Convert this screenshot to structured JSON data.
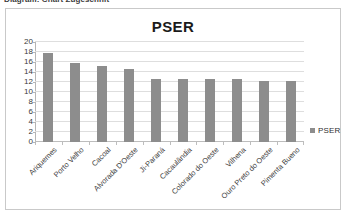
{
  "caption": {
    "text": "Diagram: Chart Zugeschnit"
  },
  "chart": {
    "legend_label": "PSER",
    "legend_swatch_color": "#8d8d8d"
  },
  "chart_data": {
    "type": "bar",
    "title": "PSER",
    "xlabel": "",
    "ylabel": "",
    "ylim": [
      0,
      20
    ],
    "ytick_step": 2,
    "yticks": [
      20,
      18,
      16,
      14,
      12,
      10,
      8,
      6,
      4,
      2,
      0
    ],
    "grid": true,
    "legend_position": "right",
    "legend": [
      "PSER"
    ],
    "bar_color": "#8d8d8d",
    "categories": [
      "Ariquemes",
      "Porto Velho",
      "Cacoal",
      "Alvorada D'Oeste",
      "Ji-Paraná",
      "Cacaulândia",
      "Colorado do Oeste",
      "Vilhena",
      "Ouro Preto do Oeste",
      "Pimenta Bueno"
    ],
    "values": [
      17.8,
      15.8,
      15.2,
      14.7,
      12.7,
      12.7,
      12.7,
      12.7,
      12.2,
      12.2
    ]
  }
}
